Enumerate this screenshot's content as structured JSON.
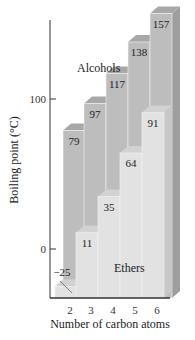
{
  "chart_data": {
    "type": "bar",
    "style": "3d-overlapped",
    "title": "",
    "xlabel": "Number of carbon atoms",
    "ylabel": "Boiling point (°C)",
    "categories": [
      "2",
      "3",
      "4",
      "5",
      "6"
    ],
    "series": [
      {
        "name": "Alcohols",
        "values": [
          79,
          97,
          117,
          138,
          157
        ],
        "color": "#b9b9b9"
      },
      {
        "name": "Ethers",
        "values": [
          -25,
          11,
          35,
          64,
          91
        ],
        "color": "#e4e4e4"
      }
    ],
    "yticks": [
      0,
      100
    ],
    "ylim": [
      -33,
      170
    ],
    "grid": false,
    "legend": "inline labels"
  },
  "labels": {
    "xlabel": "Number of carbon atoms",
    "ylabel": "Boiling point (°C)",
    "alcohols": "Alcohols",
    "ethers": "Ethers",
    "ytick_0": "0",
    "ytick_100": "100",
    "x": [
      "2",
      "3",
      "4",
      "5",
      "6"
    ],
    "alcohol_values": [
      "79",
      "97",
      "117",
      "138",
      "157"
    ],
    "ether_values": [
      "−25",
      "11",
      "35",
      "64",
      "91"
    ]
  }
}
